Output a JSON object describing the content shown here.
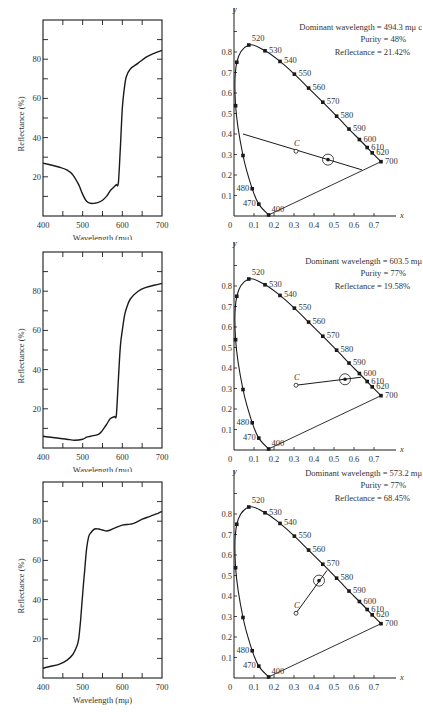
{
  "chart_data": [
    {
      "type": "line",
      "title": "",
      "xlabel": "Wavelength (mμ)",
      "ylabel": "Reflectance (%)",
      "xlim": [
        400,
        700
      ],
      "ylim": [
        0,
        100
      ],
      "xticks": [
        400,
        500,
        600,
        700
      ],
      "yticks": [
        20,
        40,
        60,
        80
      ],
      "grid": false,
      "series": [
        {
          "name": "Sample 1 reflectance",
          "x": [
            400,
            420,
            440,
            460,
            475,
            490,
            500,
            510,
            520,
            530,
            540,
            550,
            560,
            570,
            580,
            585,
            590,
            595,
            600,
            605,
            610,
            620,
            640,
            660,
            680,
            700
          ],
          "y": [
            27,
            26,
            25,
            23.5,
            21,
            16,
            11,
            7.5,
            6.5,
            6.5,
            7,
            8,
            10,
            13,
            15,
            16,
            17,
            35,
            55,
            65,
            71,
            75,
            78,
            81,
            83,
            84.5
          ]
        }
      ]
    },
    {
      "type": "scatter",
      "title": "",
      "xlabel": "x",
      "ylabel": "y",
      "xlim": [
        0,
        0.8
      ],
      "ylim": [
        0,
        0.9
      ],
      "xticks": [
        0,
        0.1,
        0.2,
        0.3,
        0.4,
        0.5,
        0.6,
        0.7
      ],
      "yticks": [
        0.1,
        0.2,
        0.3,
        0.4,
        0.5,
        0.6,
        0.7,
        0.8
      ],
      "annotations": {
        "dominant_wavelength": "Dominant wavelength = 494.3 mμ c",
        "purity": "Purity = 48%",
        "reflectance": "Reflectance = 21.42%"
      },
      "illuminant_C": [
        0.31,
        0.316
      ],
      "sample_point": [
        0.47,
        0.275
      ],
      "line_from": [
        0.045,
        0.4
      ],
      "line_to": [
        0.64,
        0.225
      ]
    },
    {
      "type": "line",
      "title": "",
      "xlabel": "Wavelength (mμ)",
      "ylabel": "Reflectance (%)",
      "xlim": [
        400,
        700
      ],
      "ylim": [
        0,
        100
      ],
      "xticks": [
        400,
        500,
        600,
        700
      ],
      "yticks": [
        20,
        40,
        60,
        80
      ],
      "grid": false,
      "series": [
        {
          "name": "Sample 2 reflectance",
          "x": [
            400,
            420,
            440,
            460,
            480,
            500,
            510,
            520,
            540,
            550,
            560,
            570,
            580,
            585,
            590,
            595,
            600,
            605,
            610,
            620,
            640,
            660,
            680,
            700
          ],
          "y": [
            6,
            5.5,
            5,
            4.5,
            4,
            4.5,
            5.5,
            6,
            7,
            9,
            12,
            15,
            16,
            17,
            35,
            52,
            60,
            67,
            71,
            76,
            80,
            82,
            83,
            84
          ]
        }
      ]
    },
    {
      "type": "scatter",
      "title": "",
      "xlabel": "x",
      "ylabel": "y",
      "xlim": [
        0,
        0.8
      ],
      "ylim": [
        0,
        0.9
      ],
      "xticks": [
        0,
        0.1,
        0.2,
        0.3,
        0.4,
        0.5,
        0.6,
        0.7
      ],
      "yticks": [
        0.1,
        0.2,
        0.3,
        0.4,
        0.5,
        0.6,
        0.7,
        0.8
      ],
      "annotations": {
        "dominant_wavelength": "Dominant wavelength = 603.5 mμ",
        "purity": "Purity = 77%",
        "reflectance": "Reflectance = 19.58%"
      },
      "illuminant_C": [
        0.31,
        0.316
      ],
      "sample_point": [
        0.555,
        0.345
      ],
      "line_from": [
        0.31,
        0.316
      ],
      "line_to": [
        0.635,
        0.355
      ]
    },
    {
      "type": "line",
      "title": "",
      "xlabel": "Wavelength (mμ)",
      "ylabel": "Reflectance (%)",
      "xlim": [
        400,
        700
      ],
      "ylim": [
        0,
        100
      ],
      "xticks": [
        400,
        500,
        600,
        700
      ],
      "yticks": [
        20,
        40,
        60,
        80
      ],
      "grid": false,
      "series": [
        {
          "name": "Sample 3 reflectance",
          "x": [
            400,
            420,
            440,
            460,
            475,
            485,
            490,
            495,
            500,
            505,
            510,
            515,
            520,
            530,
            540,
            550,
            560,
            570,
            580,
            600,
            620,
            630,
            650,
            670,
            690,
            700
          ],
          "y": [
            5,
            6,
            7,
            9,
            12,
            16,
            20,
            30,
            43,
            55,
            66,
            72,
            74,
            76,
            76,
            75.5,
            75,
            75.5,
            76.5,
            78,
            78.5,
            79,
            81,
            82.5,
            84,
            85
          ]
        }
      ]
    },
    {
      "type": "scatter",
      "title": "",
      "xlabel": "x",
      "ylabel": "y",
      "xlim": [
        0,
        0.8
      ],
      "ylim": [
        0,
        0.9
      ],
      "xticks": [
        0,
        0.1,
        0.2,
        0.3,
        0.4,
        0.5,
        0.6,
        0.7
      ],
      "yticks": [
        0.1,
        0.2,
        0.3,
        0.4,
        0.5,
        0.6,
        0.7,
        0.8
      ],
      "annotations": {
        "dominant_wavelength": "Dominant wavelength = 573.2 mμ",
        "purity": "Purity = 77%",
        "reflectance": "Reflectance = 68.45%"
      },
      "illuminant_C": [
        0.31,
        0.316
      ],
      "sample_point": [
        0.425,
        0.475
      ],
      "line_from": [
        0.31,
        0.316
      ],
      "line_to": [
        0.465,
        0.525
      ]
    }
  ],
  "spectral_locus": {
    "points": [
      {
        "wl": "400",
        "x": 0.173,
        "y": 0.005,
        "label": true
      },
      {
        "wl": "470",
        "x": 0.124,
        "y": 0.058,
        "label": true
      },
      {
        "wl": "480",
        "x": 0.091,
        "y": 0.133,
        "label": true
      },
      {
        "wl": "490",
        "x": 0.045,
        "y": 0.295,
        "label": false
      },
      {
        "wl": "500",
        "x": 0.008,
        "y": 0.538,
        "label": false
      },
      {
        "wl": "510",
        "x": 0.014,
        "y": 0.75,
        "label": false
      },
      {
        "wl": "520",
        "x": 0.074,
        "y": 0.834,
        "label": true
      },
      {
        "wl": "530",
        "x": 0.155,
        "y": 0.806,
        "label": true
      },
      {
        "wl": "540",
        "x": 0.23,
        "y": 0.754,
        "label": true
      },
      {
        "wl": "550",
        "x": 0.302,
        "y": 0.692,
        "label": true
      },
      {
        "wl": "560",
        "x": 0.373,
        "y": 0.624,
        "label": true
      },
      {
        "wl": "570",
        "x": 0.444,
        "y": 0.555,
        "label": true
      },
      {
        "wl": "580",
        "x": 0.513,
        "y": 0.487,
        "label": true
      },
      {
        "wl": "590",
        "x": 0.575,
        "y": 0.424,
        "label": true
      },
      {
        "wl": "600",
        "x": 0.627,
        "y": 0.373,
        "label": true
      },
      {
        "wl": "610",
        "x": 0.666,
        "y": 0.334,
        "label": true
      },
      {
        "wl": "620",
        "x": 0.691,
        "y": 0.308,
        "label": true
      },
      {
        "wl": "700",
        "x": 0.735,
        "y": 0.265,
        "label": true
      }
    ]
  },
  "labels": {
    "x_axis": "x",
    "y_axis": "y",
    "c_point": "C",
    "origin": "0"
  },
  "colors": {
    "ink": "#1a1a1a",
    "text": "#333333",
    "background": "#ffffff"
  }
}
